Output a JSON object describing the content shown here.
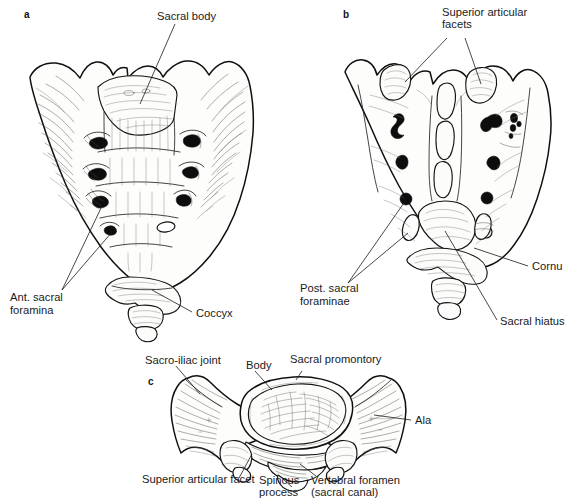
{
  "figure": {
    "background_color": "#ffffff",
    "ink_color": "#111111",
    "panels": [
      {
        "id": "a",
        "letter": "a",
        "view": "Anterior view of sacrum and coccyx",
        "labels": [
          {
            "name": "sacral-body",
            "text": "Sacral body",
            "lines": [
              "Sacral body"
            ]
          },
          {
            "name": "ant-sacral-foramina",
            "text": "Ant. sacral foramina",
            "lines": [
              "Ant. sacral",
              "foramina"
            ]
          },
          {
            "name": "coccyx",
            "text": "Coccyx",
            "lines": [
              "Coccyx"
            ]
          }
        ]
      },
      {
        "id": "b",
        "letter": "b",
        "view": "Posterior view of sacrum and coccyx",
        "labels": [
          {
            "name": "superior-articular-facets",
            "text": "Superior articular facets",
            "lines": [
              "Superior articular",
              "facets"
            ]
          },
          {
            "name": "post-sacral-foraminae",
            "text": "Post. sacral foraminae",
            "lines": [
              "Post. sacral",
              "foraminae"
            ]
          },
          {
            "name": "cornu",
            "text": "Cornu",
            "lines": [
              "Cornu"
            ]
          },
          {
            "name": "sacral-hiatus",
            "text": "Sacral hiatus",
            "lines": [
              "Sacral hiatus"
            ]
          }
        ]
      },
      {
        "id": "c",
        "letter": "c",
        "view": "Superior view of first sacral segment",
        "labels": [
          {
            "name": "sacro-iliac-joint",
            "text": "Sacro-iliac joint",
            "lines": [
              "Sacro-iliac joint"
            ]
          },
          {
            "name": "body",
            "text": "Body",
            "lines": [
              "Body"
            ]
          },
          {
            "name": "sacral-promontory",
            "text": "Sacral promontory",
            "lines": [
              "Sacral promontory"
            ]
          },
          {
            "name": "ala",
            "text": "Ala",
            "lines": [
              "Ala"
            ]
          },
          {
            "name": "superior-articular-facet",
            "text": "Superior articular facet",
            "lines": [
              "Superior articular facet"
            ]
          },
          {
            "name": "spinous-process",
            "text": "Spinous process",
            "lines": [
              "Spinous",
              "process"
            ]
          },
          {
            "name": "vertebral-foramen",
            "text": "Vertebral foramen (sacral canal)",
            "lines": [
              "Vertebral foramen",
              "(sacral canal)"
            ]
          }
        ]
      }
    ]
  },
  "text": {
    "panel_a_letter": "a",
    "panel_b_letter": "b",
    "panel_c_letter": "c",
    "sacral_body": "Sacral body",
    "ant_sacral_1": "Ant. sacral",
    "ant_sacral_2": "foramina",
    "coccyx": "Coccyx",
    "sup_art_facets_1": "Superior articular",
    "sup_art_facets_2": "facets",
    "post_sacral_1": "Post. sacral",
    "post_sacral_2": "foraminae",
    "cornu": "Cornu",
    "sacral_hiatus": "Sacral hiatus",
    "sacro_iliac_joint": "Sacro-iliac joint",
    "body": "Body",
    "sacral_promontory": "Sacral promontory",
    "ala": "Ala",
    "sup_art_facet": "Superior articular facet",
    "spinous_1": "Spinous",
    "spinous_2": "process",
    "vert_foramen_1": "Vertebral foramen",
    "vert_foramen_2": "(sacral canal)"
  }
}
